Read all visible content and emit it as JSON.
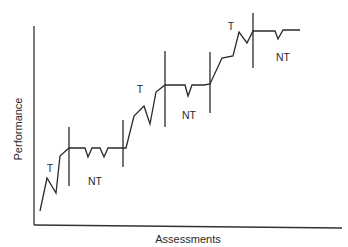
{
  "chart_data": {
    "type": "line",
    "title": "",
    "xlabel": "Assessments",
    "ylabel": "Performance",
    "grid": false,
    "legend": null,
    "series": [
      {
        "name": "Performance",
        "points_px": [
          [
            40,
            211
          ],
          [
            47,
            178
          ],
          [
            56,
            193
          ],
          [
            60,
            156
          ],
          [
            69,
            148
          ],
          [
            80,
            148
          ],
          [
            85,
            148
          ],
          [
            88,
            157
          ],
          [
            92,
            148
          ],
          [
            100,
            148
          ],
          [
            104,
            157
          ],
          [
            108,
            148
          ],
          [
            118,
            148
          ],
          [
            123,
            148
          ],
          [
            126,
            148
          ],
          [
            134,
            116
          ],
          [
            144,
            106
          ],
          [
            150,
            124
          ],
          [
            156,
            92
          ],
          [
            165,
            85
          ],
          [
            180,
            85
          ],
          [
            185,
            85
          ],
          [
            188,
            96
          ],
          [
            192,
            85
          ],
          [
            204,
            85
          ],
          [
            210,
            84
          ],
          [
            222,
            58
          ],
          [
            233,
            56
          ],
          [
            239,
            32
          ],
          [
            247,
            43
          ],
          [
            253,
            31
          ],
          [
            270,
            31
          ],
          [
            275,
            31
          ],
          [
            278,
            39
          ],
          [
            283,
            30
          ],
          [
            300,
            30
          ]
        ]
      }
    ],
    "phase_boundaries_px": [
      {
        "x": 69,
        "y1": 127,
        "y2": 186
      },
      {
        "x": 123,
        "y1": 120,
        "y2": 167
      },
      {
        "x": 165,
        "y1": 51,
        "y2": 127
      },
      {
        "x": 210,
        "y1": 52,
        "y2": 113
      },
      {
        "x": 253,
        "y1": 13,
        "y2": 68
      }
    ],
    "annotations": [
      {
        "text": "T",
        "x": 50,
        "y": 172
      },
      {
        "text": "NT",
        "x": 95,
        "y": 185
      },
      {
        "text": "T",
        "x": 140,
        "y": 93
      },
      {
        "text": "NT",
        "x": 189,
        "y": 119
      },
      {
        "text": "T",
        "x": 231,
        "y": 30
      },
      {
        "text": "NT",
        "x": 283,
        "y": 61
      }
    ],
    "axes": {
      "y_axis": {
        "x": 34,
        "y1": 26,
        "y2": 225
      },
      "x_axis": {
        "x1": 34,
        "y1": 225,
        "x2": 342,
        "y2": 228
      }
    }
  },
  "labels": {
    "xlabel": "Assessments",
    "ylabel": "Performance",
    "phase_training": "T",
    "phase_non_training": "NT"
  }
}
